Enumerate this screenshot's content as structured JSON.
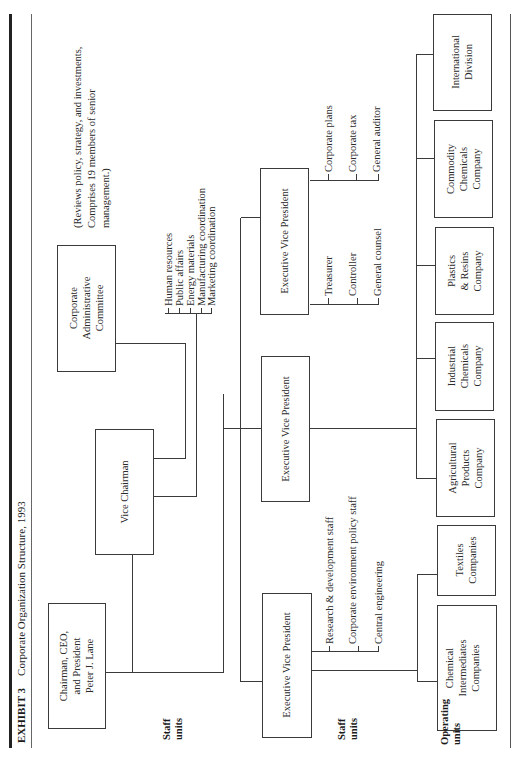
{
  "exhibit": {
    "label": "EXHIBIT 3",
    "title": "Corporate Organization Structure, 1993"
  },
  "top_management": {
    "chairman": [
      "Chairman, CEO,",
      "and President",
      "Peter J. Lane"
    ],
    "vice_chairman": "Vice Chairman",
    "committee": [
      "Corporate",
      "Administrative",
      "Committee"
    ],
    "committee_note": [
      "(Reviews policy, strategy, and investments,",
      "Comprises 19 members of senior",
      "management.)"
    ]
  },
  "row_labels": {
    "staff_units_1": [
      "Staff",
      "units"
    ],
    "staff_units_2": [
      "Staff",
      "units"
    ],
    "operating_units": [
      "Operating",
      "units"
    ]
  },
  "vice_chairman_staff": [
    "Human resources",
    "Public affairs",
    "Energy materials",
    "Manufacturing coordination",
    "Marketing coordination"
  ],
  "executive_vps": [
    {
      "title": "Executive Vice President",
      "staff": [
        "Research & development staff",
        "Corporate environment policy staff",
        "Central engineering"
      ]
    },
    {
      "title": "Executive Vice President",
      "staff": []
    },
    {
      "title": "Executive Vice President",
      "staff_left": [
        "Treasurer",
        "Controller",
        "General counsel"
      ],
      "staff_right": [
        "Corporate plans",
        "Corporate tax",
        "General auditor"
      ]
    }
  ],
  "operating_units": [
    [
      "Chemical",
      "Intermediates",
      "Companies"
    ],
    [
      "Textiles",
      "Companies"
    ],
    [
      "Agricultural",
      "Products",
      "Company"
    ],
    [
      "Industrial",
      "Chemicals",
      "Company"
    ],
    [
      "Plastics",
      "& Resins",
      "Company"
    ],
    [
      "Commodity",
      "Chemicals",
      "Company"
    ],
    [
      "International",
      "Division"
    ]
  ]
}
